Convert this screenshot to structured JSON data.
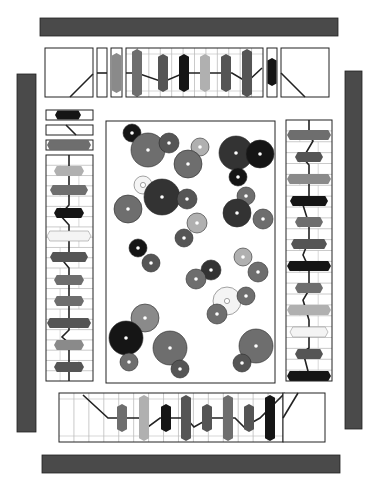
{
  "colors": {
    "frame_bar": "#4a4a4a",
    "outline": "#222222",
    "grid": "#bdbdbd",
    "hub": "#ffffff",
    "c_black": "#151515",
    "c_dark": "#333333",
    "c_mid": "#555555",
    "c_gray": "#6e6e6e",
    "c_light": "#8a8a8a",
    "c_pale": "#b0b0b0",
    "c_white": "#f4f4f4"
  },
  "frame_bars": [
    {
      "id": "top-bar",
      "x": 40,
      "y": 18,
      "w": 298,
      "h": 18
    },
    {
      "id": "bottom-bar",
      "x": 42,
      "y": 455,
      "w": 298,
      "h": 18
    },
    {
      "id": "left-bar",
      "x": 17,
      "y": 74,
      "w": 19,
      "h": 358
    },
    {
      "id": "right-bar",
      "x": 345,
      "y": 71,
      "w": 17,
      "h": 358
    }
  ],
  "top_strip": {
    "boxes": [
      {
        "x": 45,
        "y": 48,
        "w": 48,
        "h": 49,
        "line": [
          [
            70,
            97
          ],
          [
            93,
            74
          ]
        ]
      },
      {
        "x": 97,
        "y": 48,
        "w": 10,
        "h": 49,
        "line": [
          [
            97,
            73
          ],
          [
            107,
            73
          ]
        ]
      },
      {
        "x": 111,
        "y": 48,
        "w": 11,
        "h": 49,
        "pieces": [
          {
            "cx": 116.5,
            "cy": 73,
            "w": 9,
            "h": 40,
            "color": "c_light"
          }
        ]
      },
      {
        "x": 126,
        "y": 48,
        "w": 137,
        "h": 49,
        "cols": 12,
        "line": [
          [
            126,
            73
          ],
          [
            137,
            73
          ],
          [
            163,
            82
          ],
          [
            184,
            73
          ],
          [
            216,
            73
          ],
          [
            232,
            73
          ],
          [
            247,
            82
          ],
          [
            262,
            68
          ]
        ],
        "pieces": [
          {
            "cx": 137,
            "cy": 73,
            "w": 10,
            "h": 48,
            "color": "c_gray"
          },
          {
            "cx": 163,
            "cy": 73,
            "w": 10,
            "h": 38,
            "color": "c_mid"
          },
          {
            "cx": 184,
            "cy": 73,
            "w": 10,
            "h": 38,
            "color": "c_black"
          },
          {
            "cx": 205,
            "cy": 73,
            "w": 10,
            "h": 38,
            "color": "c_pale"
          },
          {
            "cx": 226,
            "cy": 73,
            "w": 10,
            "h": 38,
            "color": "c_mid"
          },
          {
            "cx": 247,
            "cy": 73,
            "w": 10,
            "h": 48,
            "color": "c_mid"
          }
        ]
      },
      {
        "x": 267,
        "y": 48,
        "w": 10,
        "h": 49,
        "pieces": [
          {
            "cx": 272,
            "cy": 72,
            "w": 9,
            "h": 28,
            "color": "c_black"
          }
        ]
      },
      {
        "x": 281,
        "y": 48,
        "w": 48,
        "h": 49,
        "line": [
          [
            281,
            73
          ],
          [
            305,
            97
          ]
        ]
      }
    ]
  },
  "bottom_strip": {
    "boxes": [
      {
        "x": 59,
        "y": 393,
        "w": 224,
        "h": 49,
        "cols": 15,
        "line": [
          [
            83,
            395
          ],
          [
            108,
            418
          ],
          [
            122,
            418
          ],
          [
            139,
            418
          ],
          [
            148,
            427
          ],
          [
            160,
            418
          ],
          [
            186,
            418
          ],
          [
            194,
            427
          ],
          [
            210,
            418
          ],
          [
            235,
            418
          ],
          [
            244,
            427
          ],
          [
            260,
            418
          ],
          [
            285,
            393
          ]
        ],
        "pieces": [
          {
            "cx": 122,
            "cy": 418,
            "w": 10,
            "h": 28,
            "color": "c_gray"
          },
          {
            "cx": 144,
            "cy": 418,
            "w": 10,
            "h": 46,
            "color": "c_pale"
          },
          {
            "cx": 166,
            "cy": 418,
            "w": 10,
            "h": 28,
            "color": "c_black"
          },
          {
            "cx": 186,
            "cy": 418,
            "w": 10,
            "h": 46,
            "color": "c_mid"
          },
          {
            "cx": 207,
            "cy": 418,
            "w": 10,
            "h": 28,
            "color": "c_mid"
          },
          {
            "cx": 228,
            "cy": 418,
            "w": 10,
            "h": 46,
            "color": "c_gray"
          },
          {
            "cx": 249,
            "cy": 418,
            "w": 10,
            "h": 28,
            "color": "c_mid"
          },
          {
            "cx": 270,
            "cy": 418,
            "w": 10,
            "h": 46,
            "color": "c_black"
          }
        ]
      },
      {
        "x": 283,
        "y": 393,
        "w": 42,
        "h": 49,
        "line": [
          [
            283,
            418
          ],
          [
            298,
            393
          ]
        ]
      }
    ]
  },
  "left_column": {
    "small_boxes": [
      {
        "x": 46,
        "y": 110,
        "w": 47,
        "h": 10,
        "pieces": [
          {
            "cx": 68,
            "cy": 115,
            "w": 26,
            "h": 9,
            "color": "c_black"
          }
        ]
      },
      {
        "x": 46,
        "y": 125,
        "w": 47,
        "h": 10,
        "line": [
          [
            66,
            125
          ],
          [
            76,
            135
          ]
        ]
      },
      {
        "x": 46,
        "y": 140,
        "w": 47,
        "h": 10,
        "pieces": [
          {
            "cx": 69,
            "cy": 145,
            "w": 44,
            "h": 9,
            "color": "c_gray"
          }
        ]
      }
    ],
    "tall_box": {
      "x": 46,
      "y": 155,
      "w": 47,
      "h": 226,
      "rows": 22,
      "line": [
        [
          69,
          155
        ],
        [
          69,
          205
        ],
        [
          60,
          215
        ],
        [
          69,
          225
        ],
        [
          69,
          255
        ],
        [
          64,
          262
        ],
        [
          69,
          268
        ],
        [
          69,
          330
        ],
        [
          62,
          337
        ],
        [
          69,
          343
        ],
        [
          69,
          381
        ]
      ],
      "pieces": [
        {
          "cx": 69,
          "cy": 171,
          "w": 30,
          "h": 10,
          "color": "c_pale"
        },
        {
          "cx": 69,
          "cy": 190,
          "w": 38,
          "h": 10,
          "color": "c_gray"
        },
        {
          "cx": 69,
          "cy": 213,
          "w": 30,
          "h": 10,
          "color": "c_black"
        },
        {
          "cx": 69,
          "cy": 236,
          "w": 44,
          "h": 10,
          "color": "c_white"
        },
        {
          "cx": 69,
          "cy": 257,
          "w": 38,
          "h": 10,
          "color": "c_mid"
        },
        {
          "cx": 69,
          "cy": 280,
          "w": 30,
          "h": 10,
          "color": "c_gray"
        },
        {
          "cx": 69,
          "cy": 301,
          "w": 30,
          "h": 10,
          "color": "c_gray"
        },
        {
          "cx": 69,
          "cy": 323,
          "w": 44,
          "h": 10,
          "color": "c_mid"
        },
        {
          "cx": 69,
          "cy": 345,
          "w": 30,
          "h": 10,
          "color": "c_light"
        },
        {
          "cx": 69,
          "cy": 367,
          "w": 30,
          "h": 10,
          "color": "c_mid"
        }
      ]
    }
  },
  "right_column": {
    "tall_box": {
      "x": 286,
      "y": 120,
      "w": 46,
      "h": 261,
      "rows": 24,
      "line": [
        [
          309,
          120
        ],
        [
          309,
          135
        ],
        [
          313,
          141
        ],
        [
          303,
          158
        ],
        [
          309,
          165
        ],
        [
          309,
          200
        ],
        [
          303,
          205
        ],
        [
          309,
          224
        ],
        [
          309,
          240
        ],
        [
          303,
          255
        ],
        [
          309,
          268
        ],
        [
          309,
          290
        ],
        [
          303,
          300
        ],
        [
          309,
          320
        ],
        [
          309,
          348
        ],
        [
          303,
          352
        ],
        [
          309,
          375
        ]
      ],
      "pieces": [
        {
          "cx": 309,
          "cy": 135,
          "w": 44,
          "h": 10,
          "color": "c_gray"
        },
        {
          "cx": 309,
          "cy": 157,
          "w": 28,
          "h": 10,
          "color": "c_mid"
        },
        {
          "cx": 309,
          "cy": 179,
          "w": 44,
          "h": 10,
          "color": "c_light"
        },
        {
          "cx": 309,
          "cy": 201,
          "w": 38,
          "h": 10,
          "color": "c_black"
        },
        {
          "cx": 309,
          "cy": 222,
          "w": 28,
          "h": 10,
          "color": "c_gray"
        },
        {
          "cx": 309,
          "cy": 244,
          "w": 36,
          "h": 10,
          "color": "c_mid"
        },
        {
          "cx": 309,
          "cy": 266,
          "w": 44,
          "h": 10,
          "color": "c_black"
        },
        {
          "cx": 309,
          "cy": 288,
          "w": 28,
          "h": 10,
          "color": "c_gray"
        },
        {
          "cx": 309,
          "cy": 310,
          "w": 44,
          "h": 10,
          "color": "c_pale"
        },
        {
          "cx": 309,
          "cy": 332,
          "w": 38,
          "h": 10,
          "color": "c_white"
        },
        {
          "cx": 309,
          "cy": 354,
          "w": 28,
          "h": 10,
          "color": "c_mid"
        },
        {
          "cx": 309,
          "cy": 376,
          "w": 44,
          "h": 10,
          "color": "c_black"
        }
      ]
    }
  },
  "center_panel": {
    "x": 106,
    "y": 121,
    "w": 169,
    "h": 262,
    "circles": [
      {
        "cx": 132,
        "cy": 133,
        "r": 9,
        "color": "c_black"
      },
      {
        "cx": 148,
        "cy": 150,
        "r": 17,
        "color": "c_gray"
      },
      {
        "cx": 169,
        "cy": 143,
        "r": 10,
        "color": "c_mid"
      },
      {
        "cx": 200,
        "cy": 147,
        "r": 9,
        "color": "c_pale"
      },
      {
        "cx": 188,
        "cy": 164,
        "r": 14,
        "color": "c_gray"
      },
      {
        "cx": 236,
        "cy": 153,
        "r": 17,
        "color": "c_dark"
      },
      {
        "cx": 260,
        "cy": 154,
        "r": 14,
        "color": "c_black"
      },
      {
        "cx": 238,
        "cy": 177,
        "r": 9,
        "color": "c_black"
      },
      {
        "cx": 143,
        "cy": 185,
        "r": 9,
        "color": "c_white"
      },
      {
        "cx": 162,
        "cy": 197,
        "r": 18,
        "color": "c_dark"
      },
      {
        "cx": 187,
        "cy": 199,
        "r": 10,
        "color": "c_mid"
      },
      {
        "cx": 128,
        "cy": 209,
        "r": 14,
        "color": "c_gray"
      },
      {
        "cx": 246,
        "cy": 196,
        "r": 9,
        "color": "c_gray"
      },
      {
        "cx": 237,
        "cy": 213,
        "r": 14,
        "color": "c_dark"
      },
      {
        "cx": 263,
        "cy": 219,
        "r": 10,
        "color": "c_gray"
      },
      {
        "cx": 197,
        "cy": 223,
        "r": 10,
        "color": "c_pale"
      },
      {
        "cx": 184,
        "cy": 238,
        "r": 9,
        "color": "c_mid"
      },
      {
        "cx": 138,
        "cy": 248,
        "r": 9,
        "color": "c_black"
      },
      {
        "cx": 151,
        "cy": 263,
        "r": 9,
        "color": "c_mid"
      },
      {
        "cx": 243,
        "cy": 257,
        "r": 9,
        "color": "c_pale"
      },
      {
        "cx": 258,
        "cy": 272,
        "r": 10,
        "color": "c_gray"
      },
      {
        "cx": 211,
        "cy": 270,
        "r": 10,
        "color": "c_dark"
      },
      {
        "cx": 196,
        "cy": 279,
        "r": 10,
        "color": "c_gray"
      },
      {
        "cx": 227,
        "cy": 301,
        "r": 14,
        "color": "c_white"
      },
      {
        "cx": 246,
        "cy": 296,
        "r": 9,
        "color": "c_gray"
      },
      {
        "cx": 217,
        "cy": 314,
        "r": 10,
        "color": "c_gray"
      },
      {
        "cx": 145,
        "cy": 318,
        "r": 14,
        "color": "c_light"
      },
      {
        "cx": 126,
        "cy": 338,
        "r": 17,
        "color": "c_black"
      },
      {
        "cx": 170,
        "cy": 348,
        "r": 17,
        "color": "c_gray"
      },
      {
        "cx": 256,
        "cy": 346,
        "r": 17,
        "color": "c_gray"
      },
      {
        "cx": 129,
        "cy": 362,
        "r": 9,
        "color": "c_gray"
      },
      {
        "cx": 180,
        "cy": 369,
        "r": 9,
        "color": "c_mid"
      },
      {
        "cx": 242,
        "cy": 363,
        "r": 9,
        "color": "c_mid"
      }
    ]
  }
}
